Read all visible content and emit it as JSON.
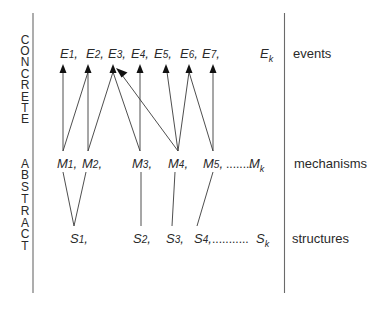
{
  "side_labels": {
    "concrete": [
      "C",
      "O",
      "N",
      "C",
      "R",
      "E",
      "T",
      "E"
    ],
    "abstract": [
      "A",
      "B",
      "S",
      "T",
      "R",
      "A",
      "C",
      "T"
    ]
  },
  "rows": {
    "events": {
      "label": "events",
      "nodes": [
        {
          "letter": "E",
          "index": "1",
          "sep": ","
        },
        {
          "letter": "E",
          "index": "2",
          "sep": ","
        },
        {
          "letter": "E",
          "index": "3",
          "sep": ","
        },
        {
          "letter": "E",
          "index": "4",
          "sep": ","
        },
        {
          "letter": "E",
          "index": "5",
          "sep": ","
        },
        {
          "letter": "E",
          "index": "6",
          "sep": ","
        },
        {
          "letter": "E",
          "index": "7",
          "sep": ","
        }
      ],
      "last": {
        "letter": "E",
        "sub": "k"
      }
    },
    "mechanisms": {
      "label": "mechanisms",
      "nodes": [
        {
          "letter": "M",
          "index": "1",
          "sep": ","
        },
        {
          "letter": "M",
          "index": "2",
          "sep": ","
        },
        {
          "letter": "M",
          "index": "3",
          "sep": ","
        },
        {
          "letter": "M",
          "index": "4",
          "sep": ","
        },
        {
          "letter": "M",
          "index": "5",
          "sep": ","
        }
      ],
      "ellipsis": "........",
      "last": {
        "letter": "M",
        "sub": "k"
      }
    },
    "structures": {
      "label": "structures",
      "nodes": [
        {
          "letter": "S",
          "index": "1",
          "sep": ","
        },
        {
          "letter": "S",
          "index": "2",
          "sep": ","
        },
        {
          "letter": "S",
          "index": "3",
          "sep": ","
        },
        {
          "letter": "S",
          "index": "4",
          "sep": ","
        }
      ],
      "ellipsis": "...........",
      "last": {
        "letter": "S",
        "sub": "k"
      }
    }
  },
  "edges": {
    "mechanism_to_event": [
      [
        "M1",
        "E1"
      ],
      [
        "M1",
        "E2"
      ],
      [
        "M2",
        "E2"
      ],
      [
        "M2",
        "E3"
      ],
      [
        "M3",
        "E3"
      ],
      [
        "M3",
        "E4"
      ],
      [
        "M4",
        "E3"
      ],
      [
        "M4",
        "E5"
      ],
      [
        "M4",
        "E6"
      ],
      [
        "M5",
        "E6"
      ],
      [
        "M5",
        "E7"
      ]
    ],
    "structure_to_mechanism": [
      [
        "S1",
        "M1"
      ],
      [
        "S1",
        "M2"
      ],
      [
        "S2",
        "M3"
      ],
      [
        "S3",
        "M4"
      ],
      [
        "S4",
        "M5"
      ]
    ]
  }
}
